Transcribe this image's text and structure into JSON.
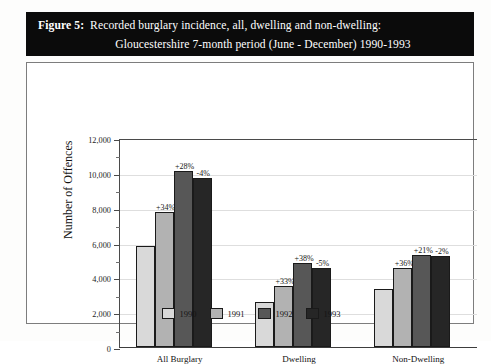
{
  "figure": {
    "label": "Figure 5:",
    "title_line_1": "Recorded burglary incidence, all, dwelling and non-dwelling:",
    "title_line_2": "Gloucestershire 7-month period (June - December) 1990-1993"
  },
  "chart_data": {
    "type": "bar",
    "title": "Recorded burglary incidence, all, dwelling and non-dwelling: Gloucestershire 7-month period (June - December) 1990-1993",
    "xlabel": "",
    "ylabel": "Number of Offences",
    "ylim": [
      0,
      12000
    ],
    "ytick_values": [
      0,
      2000,
      4000,
      6000,
      8000,
      10000,
      12000
    ],
    "ytick_labels": [
      "0",
      "2,000",
      "4,000",
      "6,000",
      "8,000",
      "10,000",
      "12,000"
    ],
    "minor_tick_interval": 1000,
    "grid": true,
    "legend_position": "bottom",
    "categories": [
      "All Burglary",
      "Dwelling",
      "Non-Dwelling"
    ],
    "series": [
      {
        "name": "1990",
        "color": "#d9d9d9",
        "values": [
          5800,
          2600,
          3350
        ],
        "labels": [
          "",
          "",
          ""
        ]
      },
      {
        "name": "1991",
        "color": "#b2b2b2",
        "values": [
          7780,
          3480,
          4550
        ],
        "labels": [
          "+34%",
          "+33%",
          "+36%"
        ]
      },
      {
        "name": "1992",
        "color": "#575757",
        "values": [
          10100,
          4800,
          5300
        ],
        "labels": [
          "+28%",
          "+38%",
          "+21%"
        ]
      },
      {
        "name": "1993",
        "color": "#262626",
        "values": [
          9700,
          4550,
          5200
        ],
        "labels": [
          "-4%",
          "-5%",
          "-2%"
        ]
      }
    ]
  }
}
